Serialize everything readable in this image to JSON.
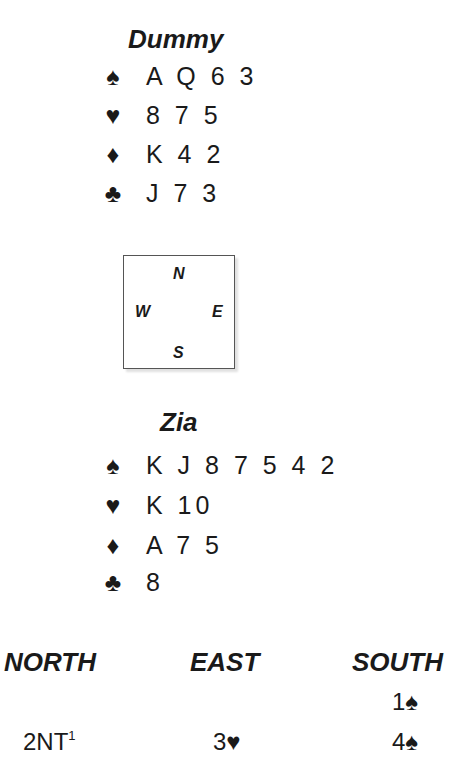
{
  "dummy": {
    "name": "Dummy",
    "hand": [
      {
        "suit": "spades",
        "symbol": "♠",
        "cards": "A Q 6 3"
      },
      {
        "suit": "hearts",
        "symbol": "♥",
        "cards": "8 7 5"
      },
      {
        "suit": "diamonds",
        "symbol": "♦",
        "cards": "K 4 2"
      },
      {
        "suit": "clubs",
        "symbol": "♣",
        "cards": "J 7 3"
      }
    ]
  },
  "compass": {
    "north": "N",
    "east": "E",
    "south": "S",
    "west": "W"
  },
  "declarer": {
    "name": "Zia",
    "hand": [
      {
        "suit": "spades",
        "symbol": "♠",
        "cards": "K J 8 7 5 4 2"
      },
      {
        "suit": "hearts",
        "symbol": "♥",
        "cards": "K 10"
      },
      {
        "suit": "diamonds",
        "symbol": "♦",
        "cards": "A 7 5"
      },
      {
        "suit": "clubs",
        "symbol": "♣",
        "cards": "8"
      }
    ]
  },
  "bidding": {
    "headers": [
      "NORTH",
      "EAST",
      "SOUTH"
    ],
    "rounds": [
      {
        "north": "",
        "east": "",
        "south": {
          "level": "1",
          "symbol": "♠"
        }
      },
      {
        "north": {
          "level": "2NT",
          "footnote": "1"
        },
        "east": {
          "level": "3",
          "symbol": "♥"
        },
        "south": {
          "level": "4",
          "symbol": "♠"
        }
      }
    ]
  }
}
